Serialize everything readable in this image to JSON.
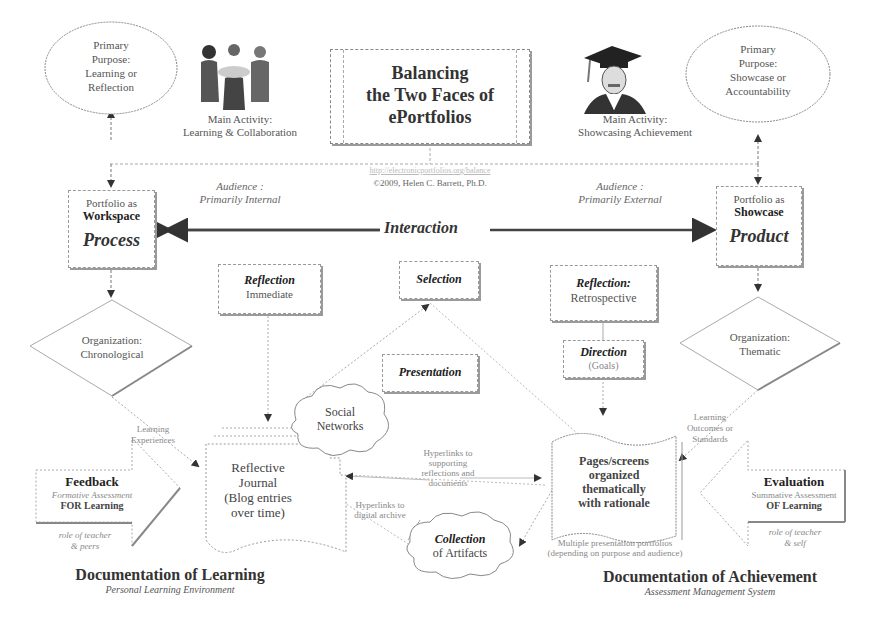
{
  "title": {
    "line1": "Balancing",
    "line2": "the Two Faces of",
    "line3": "ePortfolios",
    "url": "http://electronicportfolios.org/balance",
    "credit": "©2009, Helen C. Barrett, Ph.D."
  },
  "left": {
    "purpose": [
      "Primary",
      "Purpose:",
      "Learning or",
      "Reflection"
    ],
    "activity": [
      "Main Activity:",
      "Learning & Collaboration"
    ],
    "audience": [
      "Audience :",
      "Primarily Internal"
    ],
    "portfolio_line1": "Portfolio as",
    "portfolio_line2": "Workspace",
    "portfolio_line3": "Process",
    "organization": [
      "Organization:",
      "Chronological"
    ],
    "flow_label": [
      "Learning",
      "Experiences"
    ],
    "feedback": {
      "title": "Feedback",
      "subtitle": "Formative Assessment",
      "line3": "FOR Learning",
      "role": [
        "role of teacher",
        "& peers"
      ]
    },
    "journal": [
      "Reflective",
      "Journal",
      "(Blog entries",
      "over time)"
    ],
    "footer_title": "Documentation of Learning",
    "footer_subtitle": "Personal Learning Environment"
  },
  "right": {
    "purpose": [
      "Primary",
      "Purpose:",
      "Showcase or",
      "Accountability"
    ],
    "activity": [
      "Main Activity:",
      "Showcasing Achievement"
    ],
    "audience": [
      "Audience :",
      "Primarily External"
    ],
    "portfolio_line1": "Portfolio as",
    "portfolio_line2": "Showcase",
    "portfolio_line3": "Product",
    "organization": [
      "Organization:",
      "Thematic"
    ],
    "flow_label": [
      "Learning",
      "Outcomes or",
      "Standards"
    ],
    "evaluation": {
      "title": "Evaluation",
      "subtitle": "Summative Assessment",
      "line3": "OF Learning",
      "role": [
        "role of teacher",
        "& self"
      ]
    },
    "pages": [
      "Pages/screens",
      "organized",
      "thematically",
      "with rationale"
    ],
    "pages_note": [
      "Multiple presentation portfolios",
      "(depending on purpose and audience)"
    ],
    "footer_title": "Documentation of Achievement",
    "footer_subtitle": "Assessment Management System"
  },
  "center": {
    "interaction": "Interaction",
    "reflection_immediate": {
      "title": "Reflection",
      "subtitle": "Immediate"
    },
    "selection": "Selection",
    "presentation": "Presentation",
    "reflection_retro": {
      "title": "Reflection:",
      "subtitle": "Retrospective"
    },
    "direction": {
      "title": "Direction",
      "subtitle": "(Goals)"
    },
    "social": [
      "Social",
      "Networks"
    ],
    "hyperlinks_supporting": [
      "Hyperlinks to",
      "supporting",
      "reflections and",
      "documents"
    ],
    "hyperlinks_digital": [
      "Hyperlinks to",
      "digital archive"
    ],
    "collection": {
      "title": "Collection",
      "subtitle": "of Artifacts"
    }
  },
  "icons": {
    "left": "group-collaboration-icon",
    "right": "graduate-icon"
  }
}
